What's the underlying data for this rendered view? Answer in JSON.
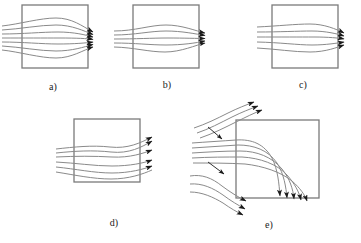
{
  "figure": {
    "background_color": "#ffffff",
    "stream_color": "#8a8a8a",
    "box_color": "#7a7a7a",
    "arrow_color": "#1a1a1a",
    "label_color": "#1a1a1a",
    "width": 361,
    "height": 243
  },
  "panels": [
    {
      "id": "a",
      "label": "a)",
      "label_x": 53,
      "label_y": 90,
      "description": "Symmetric flow through box, streamlines bulge outward at centre and converge to arrowheads at right edge",
      "box": {
        "x": 22,
        "y": 5,
        "width": 66,
        "height": 63
      },
      "stream_count": 7,
      "arrow_count": 7,
      "flow_direction": "left-to-right"
    },
    {
      "id": "b",
      "label": "b)",
      "label_x": 167,
      "label_y": 88,
      "description": "Narrow bundle of streamlines passing through box with slight symmetric bulge, arrowheads at right edge",
      "box": {
        "x": 133,
        "y": 5,
        "width": 66,
        "height": 63
      },
      "stream_count": 5,
      "arrow_count": 4,
      "flow_direction": "left-to-right"
    },
    {
      "id": "c",
      "label": "c)",
      "label_x": 303,
      "label_y": 88,
      "description": "Asymmetric flow, streamlines fan in from upper-left and converge tightly at right edge",
      "box": {
        "x": 272,
        "y": 5,
        "width": 66,
        "height": 63
      },
      "stream_count": 5,
      "arrow_count": 5,
      "flow_direction": "left-to-right"
    },
    {
      "id": "d",
      "label": "d)",
      "label_x": 114,
      "label_y": 226,
      "description": "Diverging flow, streamlines separate above and below the box and exit at right with spread arrowheads",
      "box": {
        "x": 74,
        "y": 119,
        "width": 66,
        "height": 63
      },
      "stream_count": 6,
      "arrow_count": 5,
      "flow_direction": "left-to-right-diverging"
    },
    {
      "id": "e",
      "label": "e)",
      "label_x": 269,
      "label_y": 228,
      "description": "Flow deflected around the corner of the box, one group turns up-right, one group bends sharply down past the right face, one group passes below",
      "box": {
        "x": 236,
        "y": 120,
        "width": 83,
        "height": 78
      },
      "stream_count": 11,
      "arrow_count": 12,
      "flow_direction": "deflected-around-corner"
    }
  ]
}
